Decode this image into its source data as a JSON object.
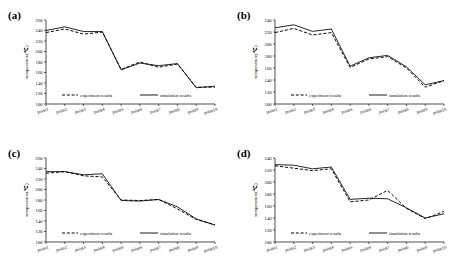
{
  "figure": {
    "panel_count": 4,
    "x_categories": [
      "point1",
      "point2",
      "point3",
      "point4",
      "point5",
      "point6",
      "point7",
      "point8",
      "point9",
      "point10"
    ],
    "y_axis_label": "temperature(℃)",
    "legend": {
      "experiment": "experiment results",
      "simulation": "simulation results"
    },
    "line_color": "#000000",
    "background": "#ffffff"
  },
  "chart_data": [
    {
      "type": "line",
      "title": "(a)",
      "panel": "a",
      "xlabel": "",
      "ylabel": "temperature(℃)",
      "categories": [
        "point1",
        "point2",
        "point3",
        "point4",
        "point5",
        "point6",
        "point7",
        "point8",
        "point9",
        "point10"
      ],
      "yticks": [
        100,
        120,
        140,
        160,
        180,
        200,
        220,
        240,
        260
      ],
      "ylim": [
        100,
        260
      ],
      "grid": false,
      "legend_position": "bottom-inside",
      "series": [
        {
          "name": "experiment results",
          "style": "dashed",
          "values": [
            236,
            238,
            243,
            234,
            233,
            237,
            166,
            176,
            180,
            172,
            170,
            176,
            132,
            132
          ]
        },
        {
          "name": "simulation results",
          "style": "solid",
          "values": [
            240,
            242,
            247,
            240,
            238,
            238,
            165,
            174,
            178,
            175,
            173,
            177,
            131,
            134
          ]
        }
      ],
      "series_points": [
        {
          "name": "experiment results",
          "style": "dashed",
          "values": [
            236,
            243,
            233,
            237,
            166,
            180,
            170,
            176,
            132,
            132
          ]
        },
        {
          "name": "simulation results",
          "style": "solid",
          "values": [
            240,
            247,
            238,
            238,
            165,
            178,
            173,
            177,
            131,
            134
          ]
        }
      ]
    },
    {
      "type": "line",
      "title": "(b)",
      "panel": "b",
      "xlabel": "",
      "ylabel": "temperature(℃)",
      "categories": [
        "point1",
        "point2",
        "point3",
        "point4",
        "point5",
        "point6",
        "point7",
        "point8",
        "point9",
        "point10"
      ],
      "yticks": [
        100,
        120,
        140,
        160,
        180,
        200,
        220,
        240
      ],
      "ylim": [
        100,
        240
      ],
      "grid": false,
      "legend_position": "bottom-inside",
      "series_points": [
        {
          "name": "experiment results",
          "style": "dashed",
          "values": [
            219,
            226,
            215,
            219,
            161,
            175,
            179,
            160,
            128,
            139
          ]
        },
        {
          "name": "simulation results",
          "style": "solid",
          "values": [
            227,
            232,
            221,
            225,
            163,
            177,
            181,
            162,
            132,
            139
          ]
        }
      ]
    },
    {
      "type": "line",
      "title": "(c)",
      "panel": "c",
      "xlabel": "",
      "ylabel": "temperature(℃)",
      "categories": [
        "point1",
        "point2",
        "point3",
        "point4",
        "point5",
        "point6",
        "point7",
        "point8",
        "point9",
        "point10"
      ],
      "yticks": [
        100,
        120,
        140,
        160,
        180,
        200,
        220,
        240,
        260
      ],
      "ylim": [
        100,
        260
      ],
      "grid": false,
      "legend_position": "bottom-inside",
      "series_points": [
        {
          "name": "experiment results",
          "style": "dashed",
          "values": [
            231,
            234,
            226,
            224,
            180,
            179,
            181,
            163,
            143,
            133
          ]
        },
        {
          "name": "simulation results",
          "style": "solid",
          "values": [
            234,
            234,
            228,
            230,
            179,
            178,
            181,
            167,
            144,
            132
          ]
        }
      ]
    },
    {
      "type": "line",
      "title": "(d)",
      "panel": "d",
      "xlabel": "",
      "ylabel": "temperature(℃)",
      "categories": [
        "point1",
        "point2",
        "point3",
        "point4",
        "point5",
        "point6",
        "point7",
        "point8",
        "point9",
        "point10"
      ],
      "yticks": [
        100,
        120,
        140,
        160,
        180,
        200,
        220,
        240
      ],
      "ylim": [
        100,
        240
      ],
      "grid": false,
      "legend_position": "bottom-inside",
      "series_points": [
        {
          "name": "experiment results",
          "style": "dashed",
          "values": [
            227,
            223,
            219,
            222,
            167,
            170,
            186,
            156,
            139,
            151
          ]
        },
        {
          "name": "simulation results",
          "style": "solid",
          "values": [
            229,
            228,
            222,
            225,
            171,
            173,
            172,
            157,
            140,
            147
          ]
        }
      ]
    }
  ]
}
